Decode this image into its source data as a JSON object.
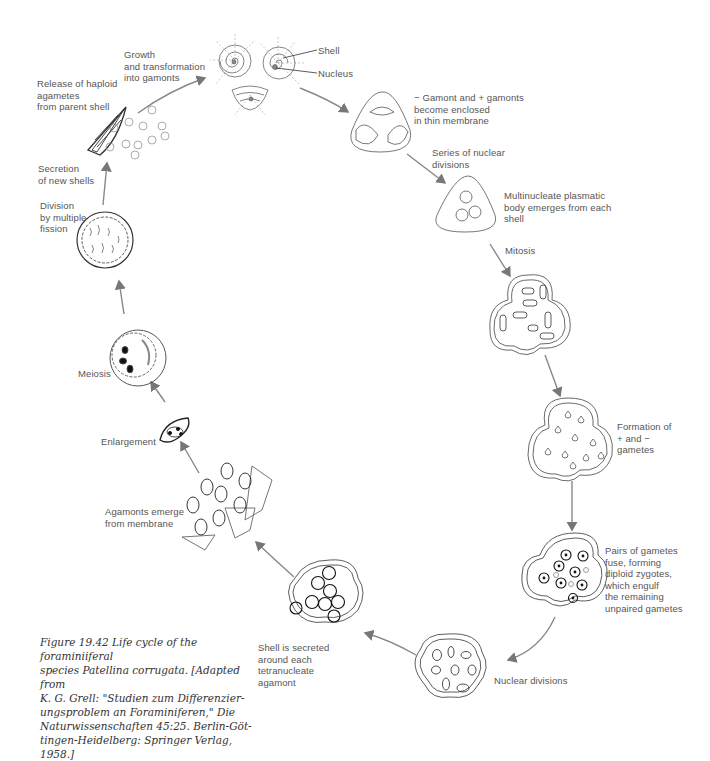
{
  "figure": {
    "caption": "Figure 19.42  Life cycle of the foraminiiferal species Patellina corrugata. [Adapted from K. G. Grell: \"Studien zum Differenzierungsproblem an Foraminiferen,\" Die Naturwissenschaften 45:25. Berlin-Göttingen-Heidelberg: Springer Verlag, 1958.]",
    "caption_lines": [
      "Figure 19.42   Life cycle of the foraminiiferal",
      "species Patellina corrugata. [Adapted from",
      "K. G. Grell: \"Studien zum Differenzier-",
      "ungsproblem an Foraminiferen,\" Die",
      "Naturwissenschaften 45:25. Berlin-Göt-",
      "tingen-Heidelberg: Springer Verlag, 1958.]"
    ]
  },
  "labels": {
    "growth": "Growth\nand transformation\ninto gamonts",
    "shell": "Shell",
    "nucleus": "Nucleus",
    "release": "Release of haploid\nagametes\nfrom parent shell",
    "secretion": "Secretion\nof new shells",
    "division": "Division\nby multiple\nfission",
    "meiosis": "Meiosis",
    "enlargement": "Enlargement",
    "agamonts": "Agamonts emerge\nfrom membrane",
    "gamont_enclosed": "− Gamont and + gamonts\nbecome enclosed\nin thin membrane",
    "series_nuclear": "Series of nuclear\ndivisions",
    "multinucleate": "Multinucleate plasmatic\nbody emerges from each\nshell",
    "mitosis": "Mitosis",
    "formation": "Formation of\n+ and −\ngametes",
    "pairs": "Pairs of gametes\nfuse, forming\ndiploid zygotes,\nwhich engulf\nthe remaining\nunpaired gametes",
    "nuclear_divisions": "Nuclear divisions",
    "shell_secreted": "Shell is secreted\naround each\ntetranucleate\nagamont"
  },
  "colors": {
    "line": "#555555",
    "arrow": "#777777",
    "text": "#555555"
  }
}
